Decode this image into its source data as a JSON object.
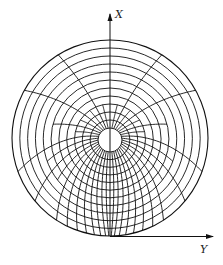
{
  "figure": {
    "type": "polar-mesh",
    "axes": {
      "x_label": "X",
      "y_label": "Y"
    },
    "geometry": {
      "outer_circle": {
        "cx": 110,
        "cy": 138,
        "r": 98
      },
      "inner_hole": {
        "cx": 110,
        "cy": 140,
        "r": 12
      },
      "ring_count": 11,
      "spoke_count_at_hole": 40
    },
    "colors": {
      "line": "#111111",
      "background": "#ffffff"
    }
  }
}
